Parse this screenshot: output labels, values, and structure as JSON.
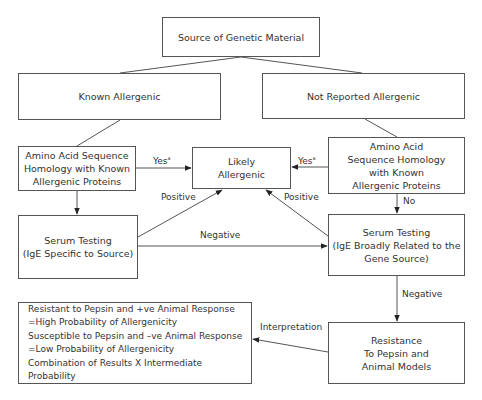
{
  "nodes": {
    "source": {
      "lines": [
        "Source of Genetic Material"
      ]
    },
    "known": {
      "lines": [
        "Known Allergenic"
      ]
    },
    "not_reported": {
      "lines": [
        "Not Reported Allergenic"
      ]
    },
    "amino_left": {
      "lines": [
        "Amino Acid Sequence",
        "Homology with Known",
        "Allergenic Proteins"
      ]
    },
    "likely": {
      "lines": [
        "Likely",
        "Allergenic"
      ]
    },
    "amino_right": {
      "lines": [
        "Amino Acid",
        "Sequence Homology",
        "with Known",
        "Allergenic Proteins"
      ]
    },
    "serum_left": {
      "lines": [
        "Serum Testing",
        "(IgE Specific to Source)"
      ]
    },
    "serum_right": {
      "lines": [
        "Serum Testing",
        "(IgE Broadly Related to the",
        "Gene Source)"
      ]
    },
    "interpretation": {
      "lines": [
        "Resistant to Pepsin and +ve Animal Response",
        "=High Probability of Allergenicity",
        "Susceptible to Pepsin and –ve Animal Response",
        "=Low Probability of Allergenicity",
        "Combination of Results X Intermediate Probability"
      ]
    },
    "resistance": {
      "lines": [
        "Resistance",
        "To Pepsin and",
        "Animal Models"
      ]
    }
  },
  "edge_labels": {
    "yes_left": "Yes",
    "yes_left_sup": "a",
    "yes_right": "Yes",
    "yes_right_sup": "a",
    "positive_left": "Positive",
    "positive_right": "Positive",
    "negative_mid": "Negative",
    "no": "No",
    "negative_right": "Negative",
    "interpretation": "Interpretation"
  }
}
